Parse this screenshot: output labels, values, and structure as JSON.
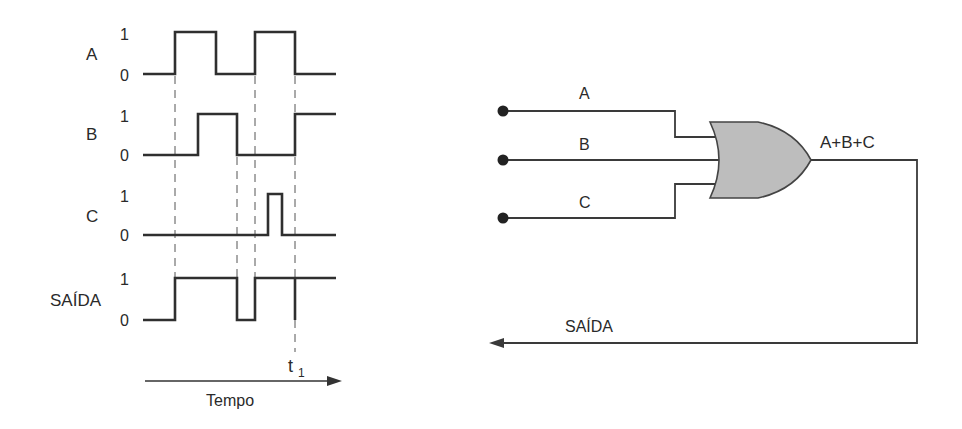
{
  "timing_diagram": {
    "signals": [
      {
        "name": "A",
        "level_high": "1",
        "level_low": "0"
      },
      {
        "name": "B",
        "level_high": "1",
        "level_low": "0"
      },
      {
        "name": "C",
        "level_high": "1",
        "level_low": "0"
      },
      {
        "name": "SAÍDA",
        "level_high": "1",
        "level_low": "0"
      }
    ],
    "time_marker": {
      "label": "t",
      "subscript": "1"
    },
    "time_axis_label": "Tempo"
  },
  "circuit": {
    "inputs": [
      {
        "label": "A"
      },
      {
        "label": "B"
      },
      {
        "label": "C"
      }
    ],
    "gate_type": "OR",
    "gate_output_expression": "A+B+C",
    "output_label": "SAÍDA",
    "gate_fill_color": "#bdbdbd",
    "line_color": "#3a3a3a"
  }
}
